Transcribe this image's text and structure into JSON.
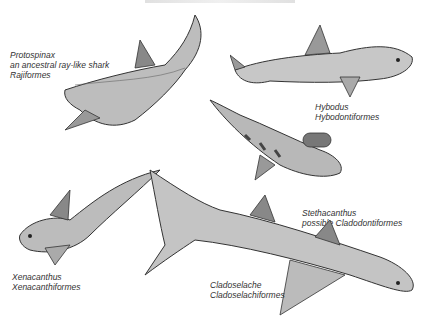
{
  "caption_top": "",
  "labels": [
    {
      "id": "protospinax",
      "lines": [
        "Protospinax",
        "an ancestral ray-like shark",
        "Rajiformes"
      ]
    },
    {
      "id": "hybodus",
      "lines": [
        "Hybodus",
        "Hybodontiformes"
      ]
    },
    {
      "id": "stethacanthus",
      "lines": [
        "Stethacanthus",
        "possible Cladodontiformes"
      ]
    },
    {
      "id": "xenacanthus",
      "lines": [
        "Xenacanthus",
        "Xenacanthiformes"
      ]
    },
    {
      "id": "cladoselache",
      "lines": [
        "Cladoselache",
        "Cladoselachiformes"
      ]
    }
  ],
  "colors": {
    "ink": "#333333",
    "shade": "#8a8a8a",
    "light": "#d9d9d9",
    "paper": "#ffffff"
  }
}
